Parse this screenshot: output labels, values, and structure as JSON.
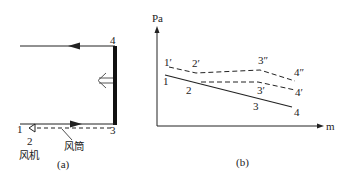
{
  "panel_a": {
    "caption": "(a)",
    "point_labels": {
      "p1": "1",
      "p2": "2",
      "p3": "3",
      "p4": "4"
    },
    "fan_label": "风机",
    "duct_label": "风筒",
    "colors": {
      "line": "#222222",
      "wall": "#111111"
    }
  },
  "panel_b": {
    "caption": "(b)",
    "y_axis_label": "Pa",
    "x_axis_label": "m",
    "solid_line": {
      "labels": [
        "1",
        "2",
        "3",
        "4"
      ]
    },
    "dashed_upper": {
      "labels": [
        "1′",
        "2′",
        "3″",
        "4″"
      ]
    },
    "dashed_lower": {
      "labels": [
        "3′",
        "4′"
      ]
    },
    "colors": {
      "line": "#222222"
    }
  }
}
